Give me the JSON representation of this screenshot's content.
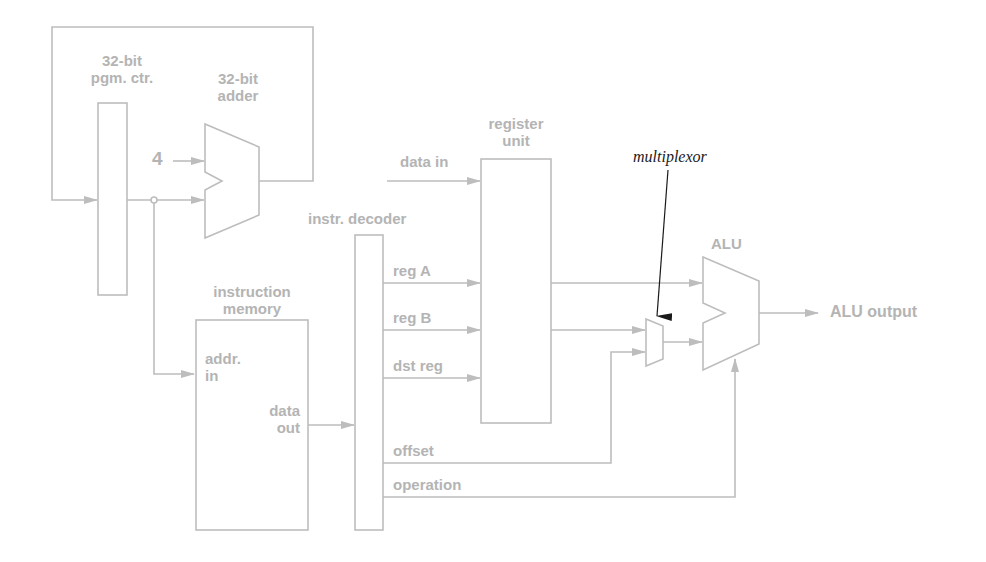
{
  "diagram": {
    "type": "processor datapath",
    "colors": {
      "line": "#bdbdbd",
      "text": "#b4b4b4",
      "annotation": "#1a1a1a"
    },
    "components": {
      "pc": {
        "label_line1": "32-bit",
        "label_line2": "pgm. ctr."
      },
      "adder": {
        "label_line1": "32-bit",
        "label_line2": "adder",
        "constant_input": "4"
      },
      "imem": {
        "label_line1": "instruction",
        "label_line2": "memory",
        "port_in_1": "addr.",
        "port_in_2": "in",
        "port_out_1": "data",
        "port_out_2": "out"
      },
      "decoder": {
        "label": "instr. decoder"
      },
      "regunit": {
        "label_line1": "register",
        "label_line2": "unit",
        "input": "data in"
      },
      "mux": {
        "annotation": "multiplexor"
      },
      "alu": {
        "label": "ALU",
        "output": "ALU output"
      }
    },
    "signals": [
      "reg A",
      "reg B",
      "dst reg",
      "offset",
      "operation"
    ]
  }
}
